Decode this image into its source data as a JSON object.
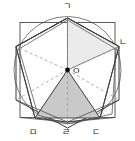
{
  "figure": {
    "center_label": "O",
    "vertices": [
      {
        "id": "v-top",
        "label": "ㄱ",
        "x": 67.5,
        "y": 18.0,
        "label_x": 63.0,
        "label_y": 2.0
      },
      {
        "id": "v-upper-right",
        "label": "ㄴ",
        "x": 119.0,
        "y": 46.5,
        "label_x": 120.0,
        "label_y": 38.0
      },
      {
        "id": "v-lower-right",
        "label": "ㄷ",
        "x": 100.0,
        "y": 118.0,
        "label_x": 93.0,
        "label_y": 127.0
      },
      {
        "id": "v-bottom",
        "label": "ㄹ",
        "x": 67.5,
        "y": 122.0,
        "label_x": 63.0,
        "label_y": 127.0
      },
      {
        "id": "v-lower-left",
        "label": "ㅁ",
        "x": 35.0,
        "y": 118.0,
        "label_x": 29.0,
        "label_y": 127.0
      },
      {
        "id": "v-upper-left",
        "label": "",
        "x": 16.0,
        "y": 46.5,
        "label_x": 4.0,
        "label_y": 38.0
      }
    ],
    "colors": {
      "stroke": "#3b3b3b",
      "stroke_light": "#6e6e6e",
      "dashed": "#9a9a9a",
      "shade_light": "#ebebeb",
      "shade_dark": "#c9c9c9",
      "label_text": "#1a1a1a",
      "background": "#ffffff"
    },
    "shapes": {
      "hexagon": "regular hexagon",
      "circle": "circumscribed circle",
      "square": "square",
      "inner_hexagon": "inner hexagon",
      "shaded_light_triangle": "triangle O-ㄱ-ㄴ",
      "shaded_dark_triangle": "triangle O-ㅁ-ㄷ"
    }
  }
}
